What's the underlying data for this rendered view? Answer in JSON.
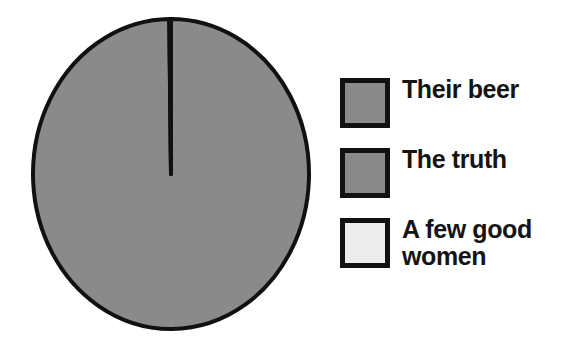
{
  "chart_data": {
    "type": "pie",
    "title": "",
    "subtitle": "",
    "xlabel": "",
    "ylabel": "",
    "grid": false,
    "legend_position": "right",
    "background_color": "#ffffff",
    "outline_color": "#111111",
    "categories": [
      "Their beer",
      "The truth",
      "A few good women"
    ],
    "values": [
      99.8,
      0.1,
      0.1
    ],
    "slice_colors": [
      "#8a8a8a",
      "#8a8a8a",
      "#ececec"
    ],
    "annotations": []
  },
  "legend": {
    "items": [
      {
        "label": "Their beer",
        "color": "#8a8a8a",
        "value": 99.8
      },
      {
        "label": "The truth",
        "color": "#8a8a8a",
        "value": 0.1
      },
      {
        "label": "A few good women",
        "color": "#ececec",
        "value": 0.1
      }
    ]
  }
}
